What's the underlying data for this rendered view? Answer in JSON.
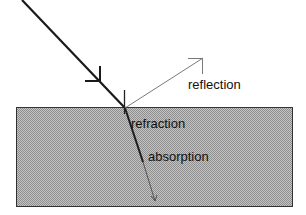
{
  "diagram": {
    "title": "",
    "labels": {
      "reflection": "reflection",
      "refraction": "refraction",
      "absorption": "absorption"
    },
    "colors": {
      "background": "#ffffff",
      "medium_fill": "#b8b8b8",
      "medium_pattern_dark": "#9a9a9a",
      "medium_border": "#333333",
      "incident_ray": "#1a1a1a",
      "reflected_ray": "#7a7a7a",
      "refracted_ray": "#222222",
      "absorption_ray": "#555555"
    },
    "elements": [
      {
        "id": "incident-ray",
        "type": "arrow",
        "from": [
          22,
          0
        ],
        "to": [
          125,
          108
        ],
        "weight": "thick"
      },
      {
        "id": "reflected-ray",
        "type": "arrow",
        "from": [
          125,
          108
        ],
        "to": [
          203,
          58
        ],
        "weight": "thin",
        "label": "reflection"
      },
      {
        "id": "medium",
        "type": "rect",
        "x": 16,
        "y": 107,
        "width": 276,
        "height": 99,
        "fill": "hatched-gray"
      },
      {
        "id": "refracted-ray",
        "type": "line",
        "from": [
          125,
          108
        ],
        "to": [
          143,
          162
        ],
        "weight": "thick",
        "label": "refraction"
      },
      {
        "id": "absorption-ray",
        "type": "arrow",
        "from": [
          143,
          162
        ],
        "to": [
          155,
          201
        ],
        "weight": "thin",
        "label": "absorption"
      }
    ]
  }
}
